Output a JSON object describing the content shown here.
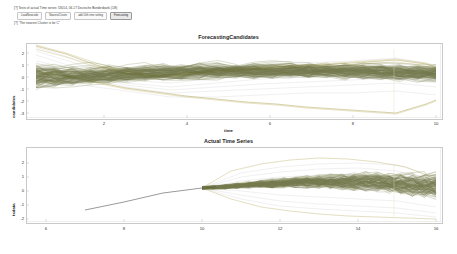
{
  "notebook": {
    "line1": "[?] Tests of actual Time series: 53014, 06-17 Deutsche Bundesbank (1/8)",
    "line2": "[?] \"The nearest Cluster is  for  C\"",
    "buttons": [
      {
        "label": "LoadNewcode",
        "active": false
      },
      {
        "label": "NearestCluster",
        "active": false
      },
      {
        "label": "add 10th time setting",
        "active": false
      },
      {
        "label": "Forecasting",
        "active": true
      }
    ]
  },
  "chart_data": [
    {
      "type": "line",
      "title": "ForecastingCandidates",
      "xlabel": "time",
      "ylabel": "candidates",
      "xlim": [
        1,
        10
      ],
      "ylim": [
        -3,
        2.6
      ],
      "xticks": [
        2,
        4,
        6,
        8,
        10
      ],
      "yticks": [
        2,
        1,
        0,
        -1,
        -2,
        -3
      ],
      "grid": false,
      "legend": "none",
      "series_count": 120,
      "colors": {
        "bundle": "#6b7031",
        "bundle_dark": "#4f5425",
        "outlier": "#b5a85c",
        "outlier_light": "#cfc48c",
        "envelope": "#d8d8d8"
      },
      "notes": "Dense bundle of ~120 forecast candidate trajectories, starting spread at t=1, converging near t=3.5, widening through t=10",
      "series": [
        {
          "name": "candidate-bundle-mean",
          "x": [
            1,
            2,
            3,
            4,
            5,
            6,
            7,
            8,
            9,
            10
          ],
          "values": [
            0.35,
            0.1,
            -0.15,
            -0.2,
            -0.1,
            0.0,
            0.1,
            0.15,
            0.1,
            0.0
          ]
        },
        {
          "name": "candidate-band-upper",
          "x": [
            1,
            2,
            3,
            4,
            5,
            6,
            7,
            8,
            9,
            10
          ],
          "values": [
            2.3,
            1.3,
            0.6,
            0.5,
            0.7,
            0.9,
            1.0,
            1.1,
            1.2,
            1.1
          ]
        },
        {
          "name": "candidate-band-lower",
          "x": [
            1,
            2,
            3,
            4,
            5,
            6,
            7,
            8,
            9,
            10
          ],
          "values": [
            -1.6,
            -1.2,
            -0.9,
            -0.9,
            -0.9,
            -1.0,
            -1.0,
            -1.1,
            -1.2,
            -1.3
          ]
        },
        {
          "name": "outlier-high",
          "x": [
            1,
            2,
            3,
            4,
            5,
            6,
            7,
            8,
            9,
            10
          ],
          "values": [
            2.45,
            1.5,
            0.9,
            0.6,
            0.8,
            1.0,
            1.2,
            1.3,
            1.5,
            1.2
          ]
        },
        {
          "name": "outlier-low",
          "x": [
            1,
            2,
            3,
            4,
            5,
            6,
            7,
            8,
            9,
            10
          ],
          "values": [
            -0.2,
            -0.6,
            -1.0,
            -1.3,
            -1.6,
            -1.9,
            -2.2,
            -2.5,
            -2.9,
            -2.2
          ]
        }
      ]
    },
    {
      "type": "line",
      "title": "Actual Time Series",
      "xlabel": "",
      "ylabel": "tsdata",
      "xlim": [
        6,
        16
      ],
      "ylim": [
        -2.6,
        2.4
      ],
      "xticks": [
        6,
        8,
        10,
        12,
        14,
        16
      ],
      "yticks": [
        2,
        1,
        0,
        -1,
        -2
      ],
      "grid": false,
      "legend": "none",
      "series_count": 120,
      "colors": {
        "history": "#6e6e6e",
        "bundle": "#6b7031",
        "bundle_dark": "#4f5425",
        "outlier": "#b5a85c",
        "envelope": "#d8d8d8"
      },
      "notes": "Single observed history line from t=7 to t=10, then fan of ~120 forecast paths from t=10 to t=16",
      "series": [
        {
          "name": "observed-history",
          "x": [
            7,
            8,
            9,
            10
          ],
          "values": [
            -0.75,
            -0.35,
            0.0,
            0.18
          ]
        },
        {
          "name": "forecast-band-upper",
          "x": [
            10,
            11,
            12,
            13,
            14,
            15,
            16
          ],
          "values": [
            0.2,
            0.9,
            1.3,
            1.5,
            1.6,
            1.5,
            1.0
          ]
        },
        {
          "name": "forecast-band-lower",
          "x": [
            10,
            11,
            12,
            13,
            14,
            15,
            16
          ],
          "values": [
            0.15,
            -0.5,
            -0.9,
            -1.1,
            -1.2,
            -1.3,
            -1.6
          ]
        },
        {
          "name": "forecast-mean",
          "x": [
            10,
            11,
            12,
            13,
            14,
            15,
            16
          ],
          "values": [
            0.18,
            0.25,
            0.3,
            0.3,
            0.25,
            0.15,
            -0.1
          ]
        }
      ]
    }
  ]
}
